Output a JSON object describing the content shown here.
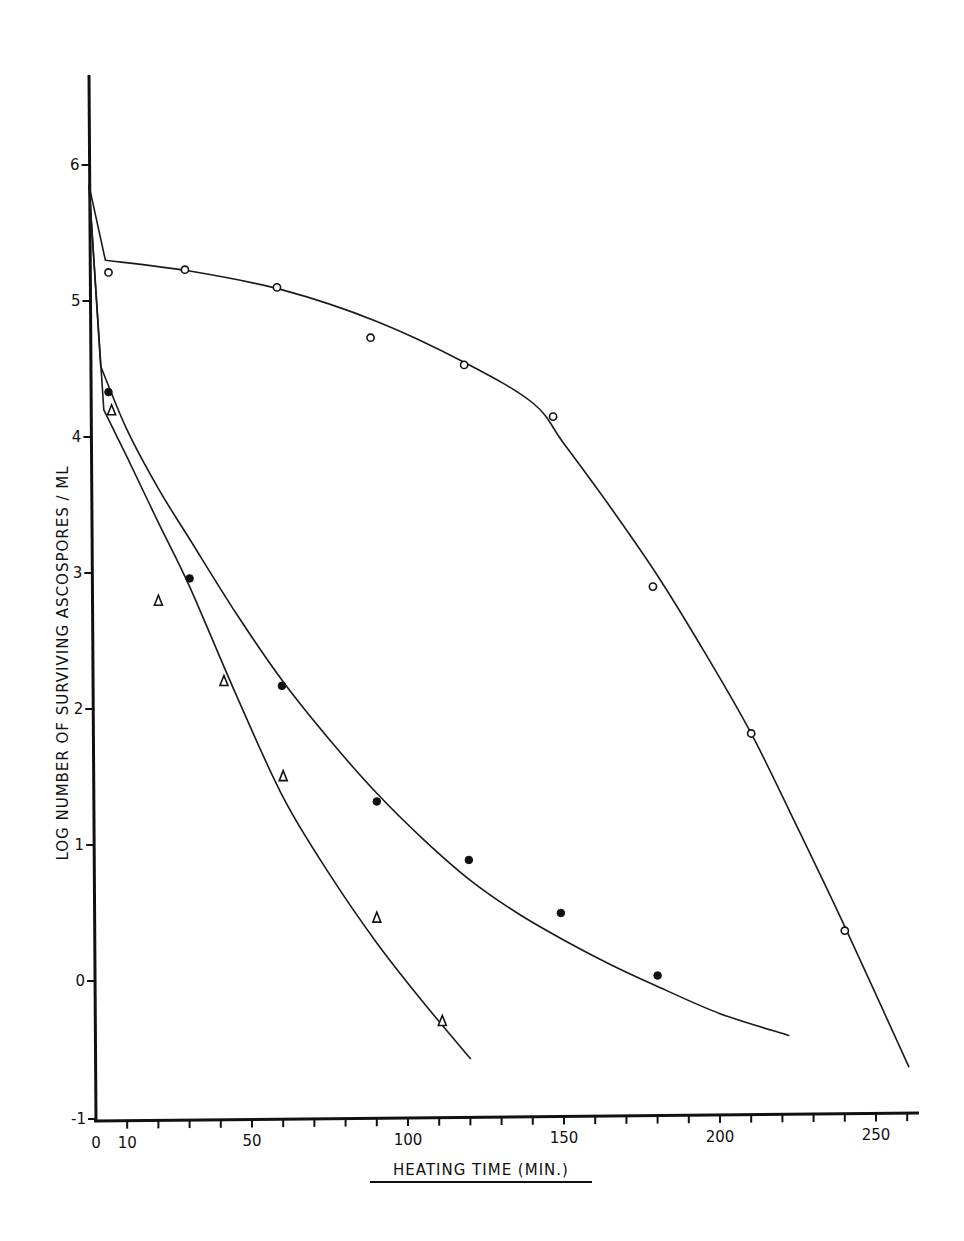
{
  "chart_data": {
    "type": "line",
    "title": "",
    "xlabel": "HEATING TIME (MIN.)",
    "ylabel": "LOG NUMBER OF SURVIVING ASCOSPORES / ML",
    "xlim": [
      0,
      265
    ],
    "ylim": [
      -1,
      6.6
    ],
    "x_ticks": [
      0,
      10,
      50,
      100,
      150,
      200,
      250
    ],
    "x_tick_labels": [
      "0",
      "10",
      "50",
      "100",
      "150",
      "200",
      "250"
    ],
    "x_minor_ticks": [
      10,
      20,
      30,
      40,
      50,
      60,
      70,
      80,
      90,
      100,
      110,
      120,
      130,
      140,
      150,
      160,
      170,
      180,
      190,
      200,
      210,
      220,
      230,
      240,
      250,
      260
    ],
    "y_ticks": [
      -1,
      0,
      1,
      2,
      3,
      4,
      5,
      6
    ],
    "y_tick_labels": [
      "-1",
      "0",
      "1",
      "2",
      "3",
      "4",
      "5",
      "6"
    ],
    "grid": false,
    "legend": null,
    "series": [
      {
        "name": "open circles",
        "marker": "open-circle",
        "points": [
          {
            "x": 4,
            "y": 5.21
          },
          {
            "x": 28.5,
            "y": 5.23
          },
          {
            "x": 58,
            "y": 5.1
          },
          {
            "x": 88,
            "y": 4.73
          },
          {
            "x": 118,
            "y": 4.53
          },
          {
            "x": 146.5,
            "y": 4.15
          },
          {
            "x": 178.5,
            "y": 2.9
          },
          {
            "x": 210,
            "y": 1.82
          },
          {
            "x": 240,
            "y": 0.37
          }
        ],
        "fitted_curve": [
          [
            0,
            5.85
          ],
          [
            3,
            5.3
          ],
          [
            30,
            5.22
          ],
          [
            60,
            5.08
          ],
          [
            90,
            4.85
          ],
          [
            118,
            4.55
          ],
          [
            140,
            4.25
          ],
          [
            150,
            3.95
          ],
          [
            165,
            3.48
          ],
          [
            180,
            2.98
          ],
          [
            195,
            2.42
          ],
          [
            210,
            1.82
          ],
          [
            225,
            1.12
          ],
          [
            240,
            0.4
          ],
          [
            260.5,
            -0.63
          ]
        ]
      },
      {
        "name": "filled circles",
        "marker": "filled-circle",
        "points": [
          {
            "x": 4,
            "y": 4.33
          },
          {
            "x": 30,
            "y": 2.96
          },
          {
            "x": 59.6,
            "y": 2.17
          },
          {
            "x": 90,
            "y": 1.32
          },
          {
            "x": 119.5,
            "y": 0.89
          },
          {
            "x": 149,
            "y": 0.5
          },
          {
            "x": 180,
            "y": 0.04
          }
        ],
        "fitted_curve": [
          [
            0,
            5.85
          ],
          [
            1.5,
            4.52
          ],
          [
            10,
            4.05
          ],
          [
            20,
            3.62
          ],
          [
            30,
            3.25
          ],
          [
            45,
            2.7
          ],
          [
            60,
            2.2
          ],
          [
            75,
            1.77
          ],
          [
            90,
            1.38
          ],
          [
            105,
            1.04
          ],
          [
            120,
            0.74
          ],
          [
            135,
            0.5
          ],
          [
            150,
            0.3
          ],
          [
            165,
            0.12
          ],
          [
            180,
            -0.04
          ],
          [
            200,
            -0.24
          ],
          [
            222,
            -0.4
          ]
        ]
      },
      {
        "name": "triangles",
        "marker": "open-triangle",
        "points": [
          {
            "x": 5,
            "y": 4.2
          },
          {
            "x": 20,
            "y": 2.8
          },
          {
            "x": 41,
            "y": 2.21
          },
          {
            "x": 60,
            "y": 1.51
          },
          {
            "x": 90,
            "y": 0.47
          },
          {
            "x": 111,
            "y": -0.29
          }
        ],
        "fitted_curve": [
          [
            0,
            5.85
          ],
          [
            2.5,
            4.2
          ],
          [
            10,
            3.85
          ],
          [
            20,
            3.37
          ],
          [
            30,
            2.9
          ],
          [
            45,
            2.1
          ],
          [
            60,
            1.35
          ],
          [
            75,
            0.78
          ],
          [
            90,
            0.28
          ],
          [
            105,
            -0.16
          ],
          [
            120,
            -0.57
          ]
        ]
      }
    ]
  },
  "axes": {
    "x_title": "HEATING TIME (MIN.)",
    "y_title": "LOG NUMBER OF SURVIVING ASCOSPORES / ML"
  }
}
